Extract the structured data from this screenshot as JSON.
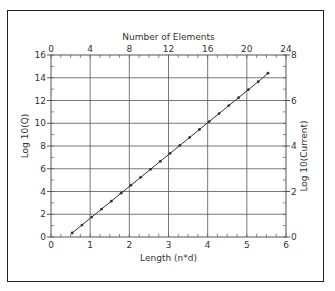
{
  "chart_data": {
    "type": "line",
    "title": "",
    "xlabel": "Length (n*d)",
    "ylabel": "Log 10(Q)",
    "x2label": "Number of Elements",
    "y2label": "Log 10(Current)",
    "xlim": [
      0,
      6
    ],
    "ylim": [
      0,
      16
    ],
    "x2lim": [
      0,
      24
    ],
    "y2lim": [
      0,
      8
    ],
    "xticks": [
      0,
      1,
      2,
      3,
      4,
      5,
      6
    ],
    "yticks": [
      0,
      2,
      4,
      6,
      8,
      10,
      12,
      14,
      16
    ],
    "x2ticks": [
      0,
      4,
      8,
      12,
      16,
      20,
      24
    ],
    "y2ticks": [
      0,
      2,
      4,
      6,
      8
    ],
    "grid": true,
    "legend": null,
    "series": [
      {
        "name": "Log 10(Q)",
        "marker": "dot",
        "color": "#333333",
        "x": [
          0.54,
          0.79,
          1.04,
          1.29,
          1.54,
          1.79,
          2.04,
          2.29,
          2.54,
          2.79,
          3.04,
          3.29,
          3.54,
          3.79,
          4.04,
          4.29,
          4.54,
          4.79,
          5.04,
          5.29,
          5.54
        ],
        "y": [
          0.35,
          1.05,
          1.75,
          2.45,
          3.15,
          3.85,
          4.55,
          5.25,
          5.95,
          6.65,
          7.35,
          8.05,
          8.75,
          9.45,
          10.15,
          10.85,
          11.55,
          12.25,
          12.95,
          13.65,
          14.4
        ]
      }
    ]
  }
}
